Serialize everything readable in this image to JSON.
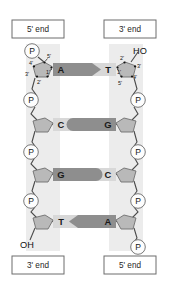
{
  "figure": {
    "background": "#ffffff"
  },
  "colors": {
    "backbone_band": "#ececec",
    "sugar_fill": "#b9b9b9",
    "sugar_stroke": "#6f6f6f",
    "phosphate_fill": "#fdfdfd",
    "phosphate_stroke": "#6a6a6a",
    "base_light": "#d8d8d8",
    "base_dark": "#8e8e8e",
    "line": "#4a4a4a",
    "text": "#1a1a1a",
    "box_stroke": "#6d6d6d"
  },
  "labels": {
    "top_left": "5' end",
    "top_right": "3' end",
    "bottom_left": "3' end",
    "bottom_right": "5' end"
  },
  "terminals": {
    "left_top": "P",
    "left_bottom": "OH",
    "right_top": "HO",
    "right_bottom": "P"
  },
  "carbons": {
    "left": [
      "5'",
      "4'",
      "3'",
      "2'",
      "1'"
    ],
    "right": [
      "2'",
      "3'",
      "4'",
      "5'",
      "1'"
    ]
  },
  "strands": {
    "left": {
      "name": "left-strand",
      "direction_top": "5'",
      "direction_bottom": "3'",
      "bases": [
        "A",
        "C",
        "G",
        "T"
      ],
      "phosphates": [
        "P",
        "P",
        "P",
        "P"
      ]
    },
    "right": {
      "name": "right-strand",
      "direction_top": "3'",
      "direction_bottom": "5'",
      "bases": [
        "T",
        "G",
        "C",
        "A"
      ],
      "phosphates": [
        "P",
        "P",
        "P",
        "P"
      ]
    }
  },
  "base_pairs": [
    {
      "left": "A",
      "right": "T",
      "shape": "arrow-right",
      "left_tone": "dark",
      "right_tone": "light"
    },
    {
      "left": "C",
      "right": "G",
      "shape": "round-right",
      "left_tone": "light",
      "right_tone": "dark"
    },
    {
      "left": "G",
      "right": "C",
      "shape": "round-left",
      "left_tone": "dark",
      "right_tone": "light"
    },
    {
      "left": "T",
      "right": "A",
      "shape": "arrow-left",
      "left_tone": "light",
      "right_tone": "dark"
    }
  ]
}
